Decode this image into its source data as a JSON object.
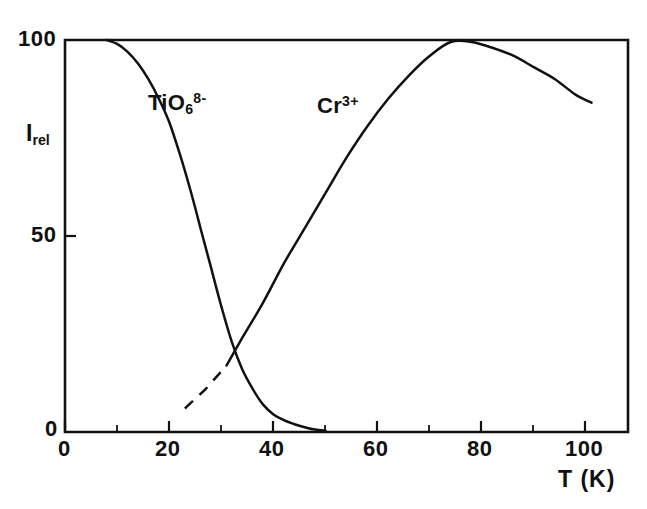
{
  "figure": {
    "background_color": "#ffffff",
    "ink_color": "#111111"
  },
  "axes": {
    "y_label": "I",
    "y_label_sub": "rel",
    "x_label": "T  (K)",
    "y_tick_labels": [
      "100",
      "50",
      "0"
    ],
    "x_tick_labels": [
      "0",
      "20",
      "40",
      "60",
      "80",
      "100"
    ]
  },
  "curves": {
    "tio6": {
      "label_base": "TiO",
      "label_sub": "6",
      "label_sup": "8-"
    },
    "cr3": {
      "label_base": "Cr",
      "label_sup": "3+"
    }
  },
  "chart_data": {
    "type": "line",
    "title": "",
    "subtitle": "",
    "xlabel": "T (K)",
    "ylabel": "I_rel",
    "xlim": [
      0,
      108
    ],
    "ylim": [
      0,
      100
    ],
    "grid": false,
    "legend": "inline-curve-labels",
    "x_ticks_major": [
      0,
      20,
      40,
      60,
      80,
      100
    ],
    "x_ticks_minor": [
      10,
      30,
      50,
      70,
      90
    ],
    "y_ticks_major": [
      0,
      50,
      100
    ],
    "annotations": [
      {
        "text": "TiO6 8-",
        "x": 24,
        "y": 78
      },
      {
        "text": "Cr 3+",
        "x": 52,
        "y": 78
      }
    ],
    "series": [
      {
        "name": "TiO6 8-",
        "style": "solid",
        "x": [
          8,
          10,
          12,
          14,
          16,
          18,
          20,
          22,
          24,
          26,
          28,
          30,
          32,
          34,
          36,
          38,
          40,
          42,
          44,
          46,
          48,
          50
        ],
        "y": [
          100,
          99,
          97,
          94,
          90,
          85,
          79,
          71,
          62,
          52,
          42,
          32,
          23,
          16,
          11,
          7,
          4.5,
          3,
          2,
          1.2,
          0.6,
          0.3
        ]
      },
      {
        "name": "Cr 3+ (extrapolated)",
        "style": "dashed",
        "x": [
          23,
          25,
          27,
          29,
          31
        ],
        "y": [
          6,
          8.5,
          11,
          14,
          17
        ]
      },
      {
        "name": "Cr 3+",
        "style": "solid",
        "x": [
          31,
          34,
          38,
          42,
          46,
          50,
          54,
          58,
          62,
          66,
          70,
          74,
          78,
          82,
          86,
          90,
          94,
          98,
          101
        ],
        "y": [
          17,
          24,
          33,
          43,
          52,
          61,
          70,
          78,
          85,
          91,
          96,
          99.5,
          99.5,
          98,
          96,
          93,
          90,
          86,
          84
        ]
      }
    ]
  }
}
